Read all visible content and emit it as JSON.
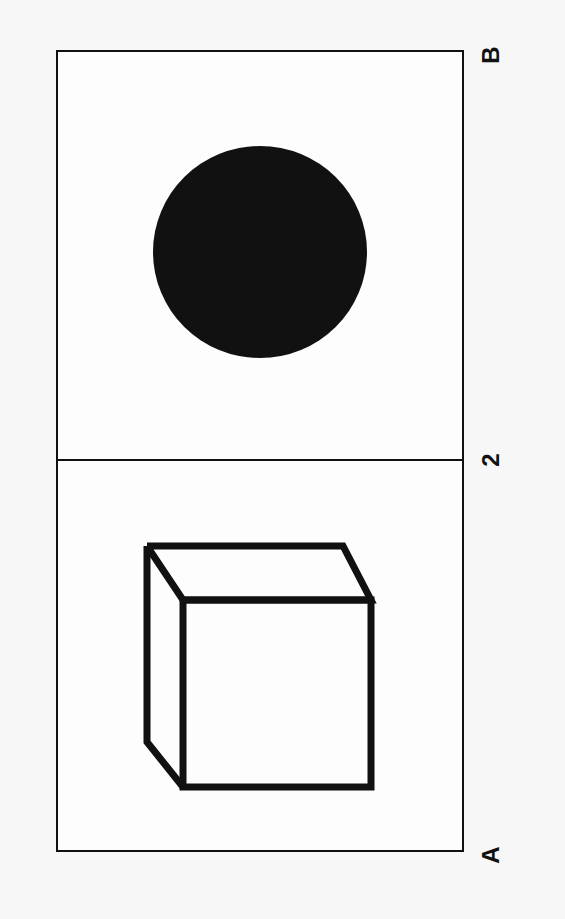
{
  "labels": {
    "top_right": "B",
    "middle_right": "2",
    "bottom_right": "A"
  },
  "panels": [
    {
      "name": "top-panel",
      "shape": "filled-circle",
      "color": "#111111"
    },
    {
      "name": "bottom-panel",
      "shape": "outline-cube",
      "color": "#111111"
    }
  ],
  "colors": {
    "ink": "#111111",
    "paper": "#fdfdfd",
    "background": "#f7f7f7"
  }
}
